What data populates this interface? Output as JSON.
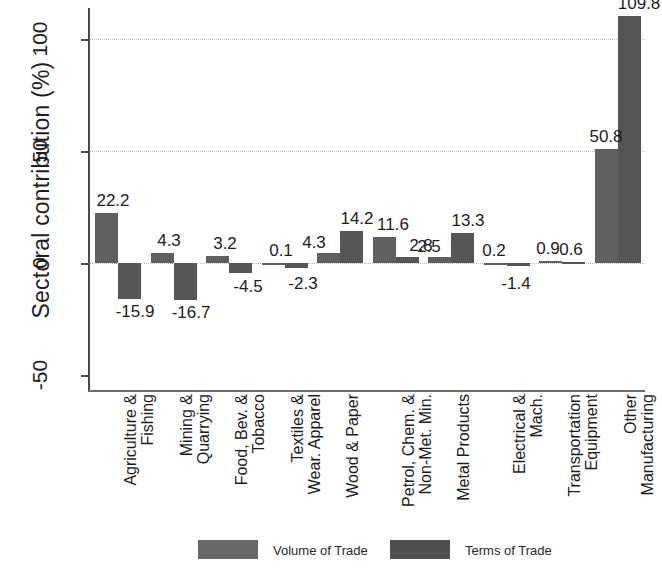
{
  "chart_data": {
    "type": "bar",
    "title": "",
    "xlabel": "",
    "ylabel": "Sectoral contribution (%)",
    "ylim": [
      -62,
      125
    ],
    "yticks": [
      -50,
      0,
      50,
      100
    ],
    "ytick_labels": [
      "-50",
      "0",
      "50",
      "100"
    ],
    "gridlines": [
      0,
      50,
      100
    ],
    "grid": true,
    "legend_position": "bottom",
    "categories": [
      "Agriculture &\nFishing",
      "Mining &\nQuarrying",
      "Food, Bev. &\nTobacco",
      "Textiles &\nWear. Apparel",
      "Wood & Paper",
      "Petrol, Chem. &\nNon-Met. Min.",
      "Metal Products",
      "Electrical &\nMach.",
      "Transportation\nEquipment",
      "Other\nManufacturing"
    ],
    "series": [
      {
        "name": "Volume of Trade",
        "color": "#5f5f5f",
        "values": [
          22.2,
          4.3,
          3.2,
          0.1,
          4.3,
          11.6,
          2.5,
          0.2,
          0.9,
          50.8
        ],
        "labels": [
          "22.2",
          "4.3",
          "3.2",
          "0.1",
          "4.3",
          "11.6",
          "2.5",
          "0.2",
          "0.9",
          "50.8"
        ]
      },
      {
        "name": "Terms of Trade",
        "color": "#555555",
        "values": [
          -15.9,
          -16.7,
          -4.5,
          -2.3,
          14.2,
          2.8,
          13.3,
          -1.4,
          0.6,
          109.8
        ],
        "labels": [
          "-15.9",
          "-16.7",
          "-4.5",
          "-2.3",
          "14.2",
          "2.8",
          "13.3",
          "-1.4",
          "0.6",
          "109.8"
        ]
      }
    ]
  },
  "legend": {
    "items": [
      {
        "label": "Volume of Trade",
        "swatch": "vol"
      },
      {
        "label": "Terms of Trade",
        "swatch": "term"
      }
    ]
  },
  "axis": {
    "y_title": "Sectoral contribution (%)"
  }
}
